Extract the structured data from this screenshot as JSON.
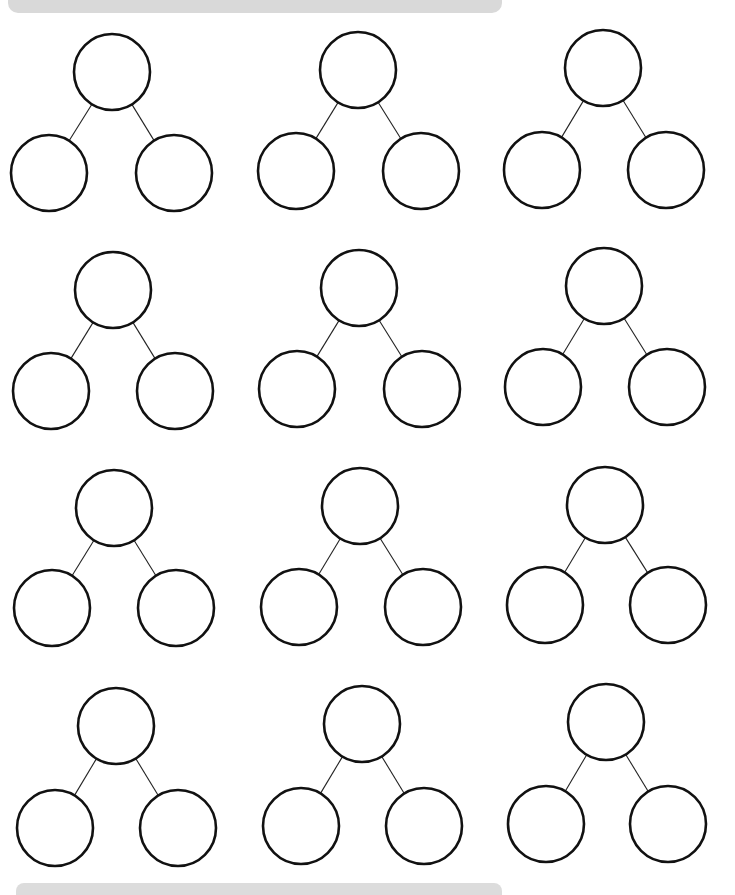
{
  "worksheet": {
    "header_label": "",
    "type": "number-bond worksheet",
    "rows": 4,
    "columns": 3,
    "diagram_count": 12,
    "circle_radius": 38,
    "stroke_color": "#111111",
    "bar_color": "#d9d9d9",
    "diagrams": [
      {
        "row": 1,
        "col": 1,
        "top": [
          112,
          72
        ],
        "left": [
          49,
          173
        ],
        "right": [
          174,
          173
        ]
      },
      {
        "row": 1,
        "col": 2,
        "top": [
          358,
          70
        ],
        "left": [
          296,
          171
        ],
        "right": [
          421,
          171
        ]
      },
      {
        "row": 1,
        "col": 3,
        "top": [
          603,
          68
        ],
        "left": [
          542,
          170
        ],
        "right": [
          666,
          170
        ]
      },
      {
        "row": 2,
        "col": 1,
        "top": [
          113,
          290
        ],
        "left": [
          51,
          391
        ],
        "right": [
          175,
          391
        ]
      },
      {
        "row": 2,
        "col": 2,
        "top": [
          359,
          288
        ],
        "left": [
          297,
          389
        ],
        "right": [
          422,
          389
        ]
      },
      {
        "row": 2,
        "col": 3,
        "top": [
          604,
          286
        ],
        "left": [
          543,
          387
        ],
        "right": [
          667,
          387
        ]
      },
      {
        "row": 3,
        "col": 1,
        "top": [
          114,
          508
        ],
        "left": [
          52,
          608
        ],
        "right": [
          176,
          608
        ]
      },
      {
        "row": 3,
        "col": 2,
        "top": [
          360,
          506
        ],
        "left": [
          299,
          607
        ],
        "right": [
          423,
          607
        ]
      },
      {
        "row": 3,
        "col": 3,
        "top": [
          605,
          505
        ],
        "left": [
          545,
          605
        ],
        "right": [
          668,
          605
        ]
      },
      {
        "row": 4,
        "col": 1,
        "top": [
          116,
          726
        ],
        "left": [
          55,
          828
        ],
        "right": [
          178,
          828
        ]
      },
      {
        "row": 4,
        "col": 2,
        "top": [
          362,
          724
        ],
        "left": [
          301,
          826
        ],
        "right": [
          424,
          826
        ]
      },
      {
        "row": 4,
        "col": 3,
        "top": [
          606,
          722
        ],
        "left": [
          546,
          824
        ],
        "right": [
          668,
          824
        ]
      }
    ]
  }
}
